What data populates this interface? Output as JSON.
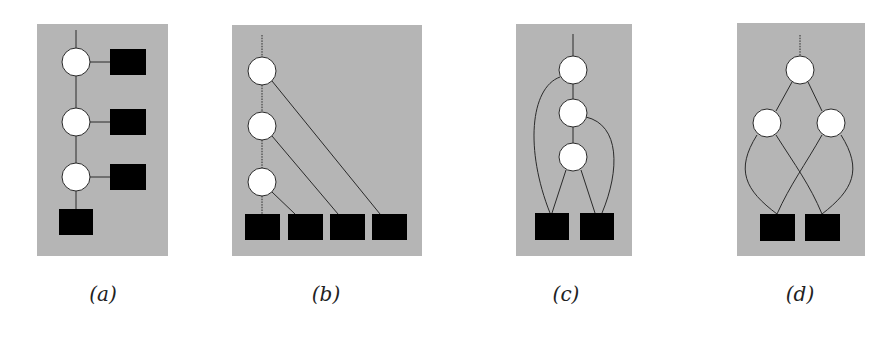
{
  "figure": {
    "panels": [
      {
        "id": "a",
        "caption": "(a)",
        "bbox": [
          37,
          24,
          131,
          232
        ],
        "circles": [
          [
            76,
            62
          ],
          [
            76,
            122
          ],
          [
            76,
            177
          ]
        ],
        "squares": [
          [
            110,
            54,
            36,
            26
          ],
          [
            110,
            110,
            36,
            26
          ],
          [
            110,
            165,
            36,
            26
          ],
          [
            59,
            209,
            34,
            26
          ]
        ],
        "description": "chain of 3 circle nodes, each connected to a square on the right; bottom circle connects to a square below"
      },
      {
        "id": "b",
        "caption": "(b)",
        "bbox": [
          232,
          25,
          190,
          231
        ],
        "circles": [
          [
            262,
            71
          ],
          [
            262,
            126
          ],
          [
            262,
            182
          ]
        ],
        "squares": [
          [
            245,
            214,
            35,
            26
          ],
          [
            288,
            214,
            35,
            26
          ],
          [
            330,
            214,
            35,
            26
          ],
          [
            372,
            214,
            35,
            26
          ]
        ],
        "description": "chain of 3 circle nodes (dotted vertical), each with a diagonal edge to one of 4 squares in a bottom row"
      },
      {
        "id": "c",
        "caption": "(c)",
        "bbox": [
          516,
          24,
          116,
          232
        ],
        "circles": [
          [
            573,
            70
          ],
          [
            573,
            113
          ],
          [
            573,
            157
          ]
        ],
        "squares": [
          [
            535,
            213,
            34,
            27
          ],
          [
            580,
            213,
            34,
            27
          ]
        ],
        "description": "chain of 3 circle nodes; top circle curves down to left square, middle curves to right square, bottom connects to both"
      },
      {
        "id": "d",
        "caption": "(d)",
        "bbox": [
          737,
          23,
          128,
          233
        ],
        "circles": [
          [
            800,
            70
          ],
          [
            767,
            123
          ],
          [
            831,
            123
          ]
        ],
        "squares": [
          [
            760,
            214,
            35,
            27
          ],
          [
            805,
            214,
            35,
            27
          ]
        ],
        "description": "binary tree: top circle with two children circles; each child connects via curved edges to both squares (crossing)"
      }
    ],
    "colors": {
      "panel_background": "#b5b5b5",
      "circle_fill": "#ffffff",
      "square_fill": "#000000",
      "edge": "#2a2a2a"
    },
    "node_radius": 14
  }
}
